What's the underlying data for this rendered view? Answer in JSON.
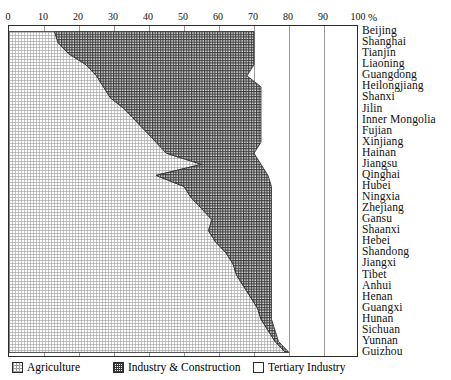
{
  "axis": {
    "unit_label": "%",
    "xticks": [
      0,
      10,
      20,
      30,
      40,
      50,
      60,
      70,
      80,
      90,
      100
    ],
    "xmin": 0,
    "xmax": 100
  },
  "legend": [
    {
      "key": "agriculture",
      "label": "Agriculture",
      "swatch": "dotted-grid-light"
    },
    {
      "key": "industry",
      "label": "Industry & Construction",
      "swatch": "cross-hatch-dark"
    },
    {
      "key": "tertiary",
      "label": "Tertiary Industry",
      "swatch": "empty-white"
    }
  ],
  "chart_data": {
    "type": "area",
    "title": "",
    "xlabel": "%",
    "ylabel": "",
    "xlim": [
      0,
      100
    ],
    "grid": true,
    "legend_position": "bottom",
    "stacked": true,
    "orientation": "horizontal",
    "categories": [
      "Beijing",
      "Shanghai",
      "Tianjin",
      "Liaoning",
      "Guangdong",
      "Heilongjiang",
      "Shanxi",
      "Jilin",
      "Inner Mongolia",
      "Fujian",
      "Xinjiang",
      "Hainan",
      "Jiangsu",
      "Qinghai",
      "Hubei",
      "Ningxia",
      "Zhejiang",
      "Gansu",
      "Shaanxi",
      "Hebei",
      "Shandong",
      "Jiangxi",
      "Tibet",
      "Anhui",
      "Henan",
      "Guangxi",
      "Hunan",
      "Sichuan",
      "Yunnan",
      "Guizhou"
    ],
    "series": [
      {
        "name": "Agriculture",
        "values": [
          13,
          14,
          17,
          22,
          25,
          27,
          29,
          33,
          36,
          39,
          42,
          45,
          55,
          42,
          50,
          52,
          55,
          58,
          57,
          59,
          62,
          64,
          65,
          67,
          69,
          71,
          72,
          74,
          76,
          79
        ]
      },
      {
        "name": "Industry & Construction",
        "values": [
          57,
          56,
          53,
          48,
          43,
          45,
          43,
          39,
          36,
          33,
          30,
          25,
          17,
          32,
          25,
          23,
          20,
          17,
          18,
          16,
          13,
          11,
          10,
          8,
          6,
          4,
          3,
          2,
          1,
          1
        ]
      },
      {
        "name": "Tertiary Industry",
        "values": [
          30,
          30,
          30,
          30,
          32,
          28,
          28,
          28,
          28,
          28,
          28,
          30,
          28,
          26,
          25,
          25,
          25,
          25,
          25,
          25,
          25,
          25,
          25,
          25,
          25,
          25,
          25,
          24,
          23,
          20
        ]
      }
    ],
    "boundary1_pct": [
      13,
      14,
      17,
      22,
      25,
      27,
      29,
      33,
      36,
      39,
      42,
      45,
      55,
      42,
      50,
      52,
      55,
      58,
      57,
      59,
      62,
      64,
      65,
      67,
      69,
      71,
      72,
      74,
      76,
      79
    ],
    "boundary2_pct": [
      70,
      70,
      70,
      70,
      68,
      72,
      72,
      72,
      72,
      72,
      72,
      70,
      72,
      74,
      75,
      75,
      75,
      75,
      75,
      75,
      75,
      75,
      75,
      75,
      75,
      75,
      75,
      76,
      77,
      80
    ]
  }
}
